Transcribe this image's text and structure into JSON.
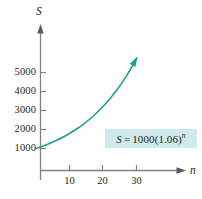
{
  "chart_data": {
    "type": "line",
    "title": "",
    "xlabel": "n",
    "ylabel": "S",
    "equation_label": "S = 1000(1.06)^n",
    "equation_parts": {
      "lhs": "S",
      "operator": "=",
      "coefficient": "1000",
      "base": "(1.06)",
      "exponent": "n"
    },
    "formula": {
      "initial": 1000,
      "growth_rate": 1.06
    },
    "xlim": [
      0,
      40
    ],
    "ylim": [
      0,
      6500
    ],
    "xticks": [
      10,
      20,
      30
    ],
    "xtick_labels": [
      "10",
      "20",
      "30"
    ],
    "yticks": [
      1000,
      2000,
      3000,
      4000,
      5000
    ],
    "ytick_labels": [
      "1000",
      "2000",
      "3000",
      "4000",
      "5000"
    ],
    "grid": false,
    "legend": "none",
    "axis_arrows": true,
    "curve_arrow_end": true,
    "series": [
      {
        "name": "S = 1000(1.06)^n",
        "color": "#1f9e8f",
        "x": [
          0,
          2,
          4,
          6,
          8,
          10,
          12,
          14,
          16,
          18,
          20,
          22,
          24,
          26,
          28,
          30
        ],
        "y": [
          1000,
          1124,
          1262,
          1419,
          1594,
          1791,
          2012,
          2261,
          2540,
          2854,
          3207,
          3604,
          4049,
          4549,
          5112,
          5743
        ]
      }
    ],
    "colors": {
      "curve": "#1f9e8f",
      "axis": "#808285",
      "text": "#231f20",
      "equation_highlight": "#cfe9ec"
    }
  },
  "axes": {
    "y_axis_name": "S",
    "x_axis_name": "n"
  }
}
